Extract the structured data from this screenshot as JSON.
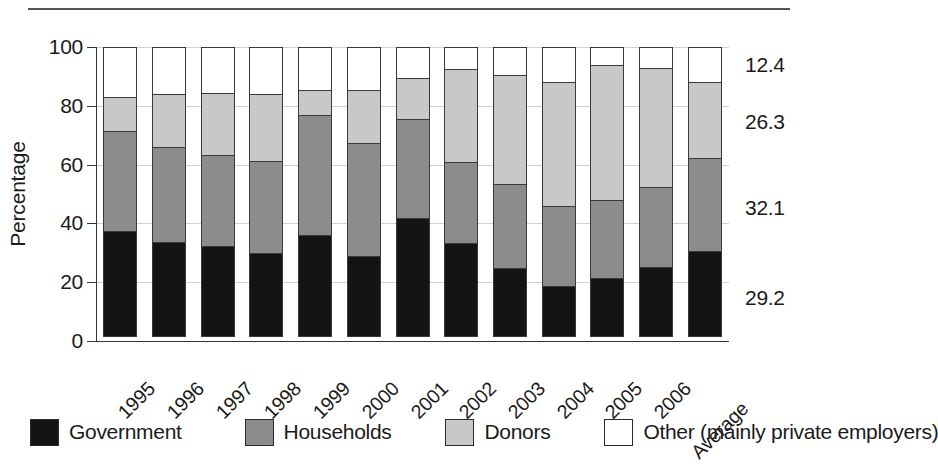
{
  "chart_data": {
    "type": "bar",
    "subtype": "stacked-bar-100-percent",
    "title": "",
    "xlabel": "",
    "ylabel": "Percentage",
    "ylim": [
      0,
      100
    ],
    "yticks": [
      0,
      20,
      40,
      60,
      80,
      100
    ],
    "ytick_labels": [
      "0",
      "20",
      "40",
      "60",
      "80",
      "100"
    ],
    "grid": "horizontal",
    "legend_position": "bottom",
    "categories": [
      "1995",
      "1996",
      "1997",
      "1998",
      "1999",
      "2000",
      "2001",
      "2002",
      "2003",
      "2004",
      "2005",
      "2006",
      "Average"
    ],
    "series": [
      {
        "name": "Government",
        "color": "#141414",
        "values": [
          36.0,
          32.2,
          31.0,
          28.6,
          34.6,
          27.6,
          40.5,
          32.0,
          23.4,
          17.5,
          20.0,
          24.0,
          29.2
        ]
      },
      {
        "name": "Households",
        "color": "#8c8c8c",
        "values": [
          34.5,
          32.8,
          31.5,
          31.9,
          41.4,
          39.0,
          34.0,
          28.0,
          29.1,
          27.5,
          27.0,
          27.5,
          32.1
        ]
      },
      {
        "name": "Donors",
        "color": "#c8c8c8",
        "values": [
          12.0,
          18.5,
          21.5,
          23.0,
          9.0,
          18.4,
          14.5,
          32.0,
          37.5,
          42.5,
          46.5,
          41.0,
          26.3
        ]
      },
      {
        "name": "Other (mainly private employers)",
        "color": "#ffffff",
        "values": [
          17.5,
          16.5,
          16.0,
          16.5,
          15.0,
          15.0,
          11.0,
          8.0,
          10.0,
          12.5,
          6.5,
          7.5,
          12.4
        ]
      }
    ],
    "annotations": [
      {
        "label": "12.4",
        "series": "Other (mainly private employers)",
        "category": "Average",
        "y": 93.8
      },
      {
        "label": "26.3",
        "series": "Donors",
        "category": "Average",
        "y": 74.4
      },
      {
        "label": "32.1",
        "series": "Households",
        "category": "Average",
        "y": 45.2
      },
      {
        "label": "29.2",
        "series": "Government",
        "category": "Average",
        "y": 14.6
      }
    ]
  },
  "axis": {
    "ylabel": "Percentage",
    "ytick_0": "0",
    "ytick_20": "20",
    "ytick_40": "40",
    "ytick_60": "60",
    "ytick_80": "80",
    "ytick_100": "100"
  },
  "legend": {
    "items": [
      {
        "label": "Government",
        "color": "#141414"
      },
      {
        "label": "Households",
        "color": "#8c8c8c"
      },
      {
        "label": "Donors",
        "color": "#c8c8c8"
      },
      {
        "label": "Other (mainly private employers)",
        "color": "#ffffff"
      }
    ]
  }
}
